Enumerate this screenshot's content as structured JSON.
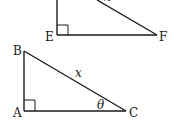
{
  "diagram": {
    "top_triangle": {
      "vertices": {
        "E": "E",
        "F": "F"
      },
      "partial_label": "x",
      "right_angle_at": "E"
    },
    "bottom_triangle": {
      "vertices": {
        "A": "A",
        "B": "B",
        "C": "C"
      },
      "hypotenuse_label": "x",
      "angle_label": "θ",
      "right_angle_at": "A"
    },
    "colors": {
      "stroke": "#1a1a1a",
      "background": "#ffffff"
    }
  }
}
